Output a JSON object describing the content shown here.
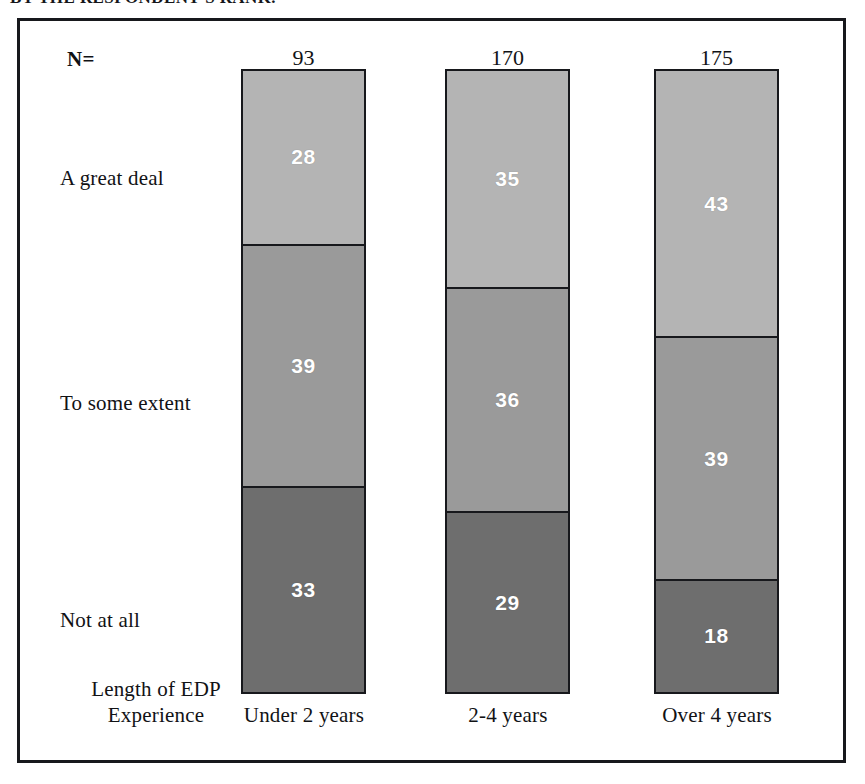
{
  "caption": "BY THE RESPONDENT'S RANK.",
  "chart": {
    "n_label": "N=",
    "axis_title_line1": "Length of EDP",
    "axis_title_line2": "Experience",
    "colors": {
      "a_great_deal": "#b4b4b4",
      "to_some_extent": "#9a9a9a",
      "not_at_all": "#6e6e6e",
      "outline": "#17181c",
      "value_text": "#ffffff",
      "background": "#ffffff"
    }
  },
  "chart_data": {
    "type": "bar",
    "subtype": "stacked-100-percent-vertical",
    "title": "BY THE RESPONDENT'S RANK.",
    "xlabel": "Length of EDP Experience",
    "ylabel": "",
    "ylim": [
      0,
      100
    ],
    "grid": false,
    "legend_position": "left-row-labels",
    "orientation": "vertical",
    "stack_order_top_to_bottom": [
      "A great deal",
      "To some extent",
      "Not at all"
    ],
    "categories": [
      "Under 2 years",
      "2-4 years",
      "Over 4 years"
    ],
    "sample_sizes": [
      93,
      170,
      175
    ],
    "sample_size_label": "N=",
    "series": [
      {
        "name": "A great deal",
        "values": [
          28,
          35,
          43
        ],
        "color": "#b4b4b4"
      },
      {
        "name": "To some extent",
        "values": [
          39,
          36,
          39
        ],
        "color": "#9a9a9a"
      },
      {
        "name": "Not at all",
        "values": [
          33,
          29,
          18
        ],
        "color": "#6e6e6e"
      }
    ],
    "units": "percent",
    "annotations": []
  }
}
